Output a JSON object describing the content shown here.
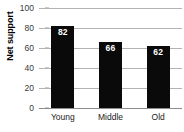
{
  "chart_data": {
    "type": "bar",
    "title": "",
    "xlabel": "",
    "ylabel": "Net support",
    "categories": [
      "Young",
      "Middle",
      "Old"
    ],
    "values": [
      82,
      66,
      62
    ],
    "value_labels": [
      "82",
      "66",
      "62"
    ],
    "ylim": [
      0,
      100
    ],
    "yticks": [
      0,
      20,
      40,
      60,
      80,
      100
    ],
    "ytick_labels": [
      "0",
      "20",
      "40",
      "60",
      "80",
      "100"
    ],
    "grid": true,
    "grid_axis": "y",
    "legend": "none",
    "bar_color": "#0a0a0a",
    "value_label_color": "#ffffff",
    "gridline_color": "#b4b4b4",
    "background_color": "#ffffff"
  }
}
